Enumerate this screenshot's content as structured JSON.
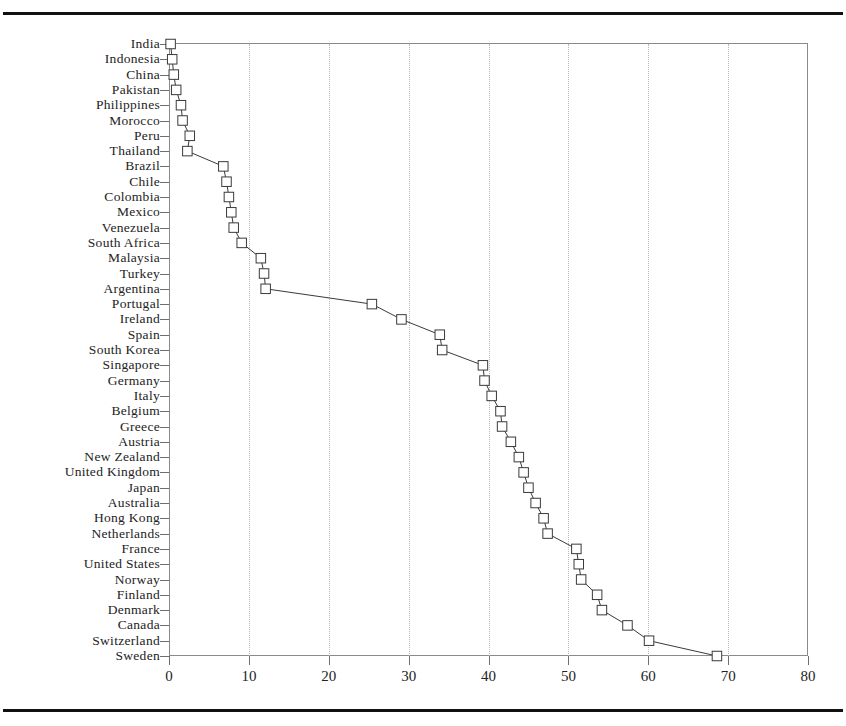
{
  "figure": {
    "top_rule": "horizontal-rule",
    "bottom_rule": "horizontal-rule"
  },
  "chart_data": {
    "type": "line",
    "title": "",
    "subtitle": "",
    "xlabel": "",
    "ylabel": "",
    "orientation": "horizontal",
    "grid": "vertical-dotted-gridlines",
    "legend": "none",
    "xlim": [
      0,
      80
    ],
    "xticks": [
      0,
      10,
      20,
      30,
      40,
      50,
      60,
      70,
      80
    ],
    "xtick_labels": [
      "0",
      "10",
      "20",
      "30",
      "40",
      "50",
      "60",
      "70",
      "80"
    ],
    "marker": "open-square",
    "categories": [
      "India",
      "Indonesia",
      "China",
      "Pakistan",
      "Philippines",
      "Morocco",
      "Peru",
      "Thailand",
      "Brazil",
      "Chile",
      "Colombia",
      "Mexico",
      "Venezuela",
      "South Africa",
      "Malaysia",
      "Turkey",
      "Argentina",
      "Portugal",
      "Ireland",
      "Spain",
      "South Korea",
      "Singapore",
      "Germany",
      "Italy",
      "Belgium",
      "Greece",
      "Austria",
      "New Zealand",
      "United Kingdom",
      "Japan",
      "Australia",
      "Hong Kong",
      "Netherlands",
      "France",
      "United States",
      "Norway",
      "Finland",
      "Denmark",
      "Canada",
      "Switzerland",
      "Sweden"
    ],
    "values": [
      0.2,
      0.4,
      0.6,
      0.9,
      1.5,
      1.7,
      2.6,
      2.3,
      6.8,
      7.2,
      7.5,
      7.8,
      8.1,
      9.1,
      11.5,
      11.9,
      12.1,
      25.4,
      29.1,
      33.9,
      34.2,
      39.3,
      39.5,
      40.4,
      41.5,
      41.7,
      42.8,
      43.8,
      44.4,
      45.0,
      45.9,
      46.9,
      47.4,
      51.0,
      51.3,
      51.6,
      53.6,
      54.2,
      57.4,
      60.1,
      68.6
    ]
  },
  "colors": {
    "marker_fill": "#ffffff",
    "marker_stroke": "#3a3a3a",
    "line": "#3a3a3a",
    "grid": "#bdb6b2",
    "frame": "#8a8a8a",
    "text": "#232323",
    "rule": "#111111"
  }
}
